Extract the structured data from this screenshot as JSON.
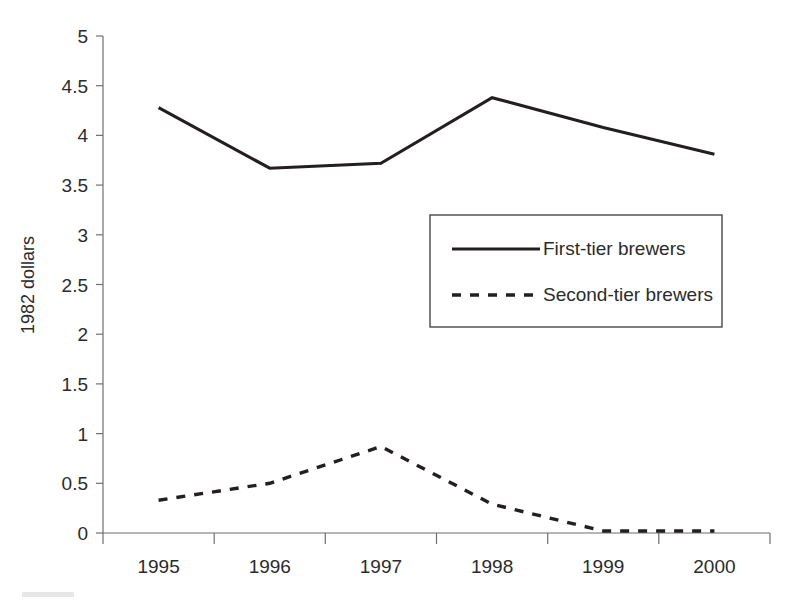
{
  "chart_data": {
    "type": "line",
    "title": "",
    "subtitle": "",
    "xlabel": "",
    "ylabel": "1982 dollars",
    "categories": [
      "1995",
      "1996",
      "1997",
      "1998",
      "1999",
      "2000"
    ],
    "series": [
      {
        "name": "First-tier brewers",
        "style": "solid",
        "color": "#231f20",
        "values": [
          4.28,
          3.67,
          3.72,
          4.38,
          4.08,
          3.81
        ]
      },
      {
        "name": "Second-tier brewers",
        "style": "dashed",
        "color": "#231f20",
        "values": [
          0.33,
          0.5,
          0.87,
          0.29,
          0.02,
          0.02
        ]
      }
    ],
    "ylim": [
      0,
      5
    ],
    "ytick_step": 0.5,
    "ytick_labels": [
      "0",
      "0.5",
      "1",
      "1.5",
      "2",
      "2.5",
      "3",
      "3.5",
      "4",
      "4.5",
      "5"
    ],
    "xtick_labels": [
      "1995",
      "1996",
      "1997",
      "1998",
      "1999",
      "2000"
    ],
    "grid": false,
    "legend_position": "center",
    "legend_entries": [
      "First-tier brewers",
      "Second-tier brewers"
    ]
  },
  "axes": {
    "y_title": "1982 dollars"
  },
  "legend": {
    "item_1_label": "First-tier brewers",
    "item_2_label": "Second-tier brewers"
  }
}
